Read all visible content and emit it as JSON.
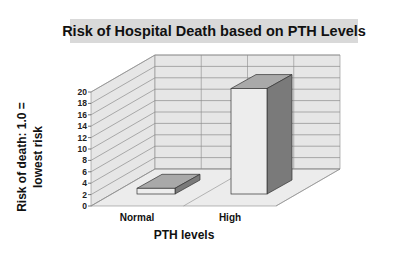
{
  "title": "Risk of Hospital Death based on PTH Levels",
  "chart_data": {
    "type": "bar",
    "style": "3d-column",
    "title": "Risk of Hospital Death based on PTH Levels",
    "xlabel": "PTH levels",
    "ylabel": "Risk of death: 1.0 = lowest risk",
    "ylabel_lines": [
      "Risk of death: 1.0 =",
      "lowest risk"
    ],
    "categories": [
      "Normal",
      "High"
    ],
    "values": [
      1.0,
      18.5
    ],
    "ylim": [
      0,
      20
    ],
    "yticks": [
      "0",
      "2",
      "4",
      "6",
      "8",
      "10",
      "12",
      "14",
      "16",
      "18",
      "20"
    ],
    "grid": true,
    "legend": null
  },
  "colors": {
    "title_bg": "#d9d9d9",
    "wall": "#e6e6e6",
    "floor": "#ececec",
    "grid": "#8c8c8c",
    "bar_front": "#ededed",
    "bar_side": "#7a7a7a",
    "bar_top": "#a9a9a9"
  }
}
